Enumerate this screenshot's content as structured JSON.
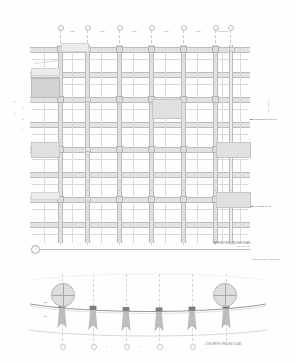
{
  "sheet": {
    "drawing_type": "architectural-construction-drawing",
    "background_color": "#fefefe",
    "line_color": "#bdbdbd",
    "shade_color": "#e0e0e0",
    "dark_shade_color": "#d2d2d2"
  },
  "plan": {
    "title": "REFLECTED CEILING PLAN",
    "scale": "SCALE 1:50",
    "detail_marker": "1",
    "column_grid_labels": [
      "1",
      "2",
      "3",
      "4",
      "5",
      "6",
      "7",
      "8"
    ],
    "span_labels": [
      "7200",
      "7200",
      "7200",
      "7200",
      "7200",
      "7200",
      "7200"
    ],
    "row_labels": [
      "A",
      "B",
      "C",
      "D",
      "E",
      "F"
    ],
    "left_dimensions": [
      "A",
      "B",
      "C",
      "D",
      "E",
      "F"
    ],
    "right_callouts": [
      {
        "text": "SUSPENDED CEILING"
      },
      {
        "text": "EXPOSED SLAB"
      }
    ],
    "top_note": "ALUMINIUM",
    "vertical_stamp": "GRID LINE",
    "shaded_panels": [
      {
        "id": "panel-a",
        "tone": "light"
      },
      {
        "id": "panel-b",
        "tone": "dark"
      },
      {
        "id": "panel-c",
        "tone": "normal"
      },
      {
        "id": "panel-d",
        "tone": "normal"
      },
      {
        "id": "panel-e",
        "tone": "normal"
      },
      {
        "id": "panel-f",
        "tone": "normal"
      }
    ]
  },
  "section": {
    "title": "LONGITUDINAL SECTION",
    "detail_bubbles": [
      {
        "id": "detail-left",
        "label": ""
      },
      {
        "id": "detail-right",
        "label": ""
      }
    ],
    "level_labels": [
      "RL",
      "FL"
    ],
    "base_note": "CONCRETE GROUND SLAB",
    "grid_labels": [
      "1",
      "2",
      "3",
      "4",
      "5"
    ],
    "column_count": 6
  }
}
